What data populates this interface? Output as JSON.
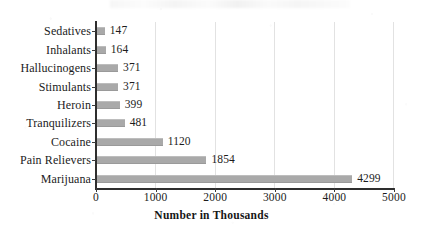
{
  "chart_data": {
    "type": "bar",
    "orientation": "horizontal",
    "title": "",
    "xlabel": "Number in Thousands",
    "ylabel": "",
    "xlim": [
      0,
      5000
    ],
    "xticks": [
      "0",
      "1000",
      "2000",
      "3000",
      "4000",
      "5000"
    ],
    "grid": true,
    "legend": false,
    "bar_color": "#a9a9a9",
    "axis_color": "#2e2e2e",
    "gridline_color": "#e2e2e2",
    "categories": [
      "Sedatives",
      "Inhalants",
      "Hallucinogens",
      "Stimulants",
      "Heroin",
      "Tranquilizers",
      "Cocaine",
      "Pain Relievers",
      "Marijuana"
    ],
    "values": [
      147,
      164,
      371,
      371,
      399,
      481,
      1120,
      1854,
      4299
    ],
    "data_labels": [
      "147",
      "164",
      "371",
      "371",
      "399",
      "481",
      "1120",
      "1854",
      "4299"
    ]
  }
}
